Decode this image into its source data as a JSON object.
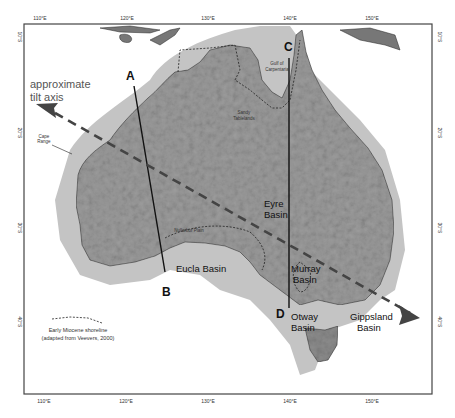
{
  "map": {
    "title": "Australia relief map with tilt axis and cross-sections",
    "frame": {
      "left": 24,
      "top": 24,
      "right": 432,
      "bottom": 394
    },
    "longitude_ticks": [
      {
        "label": "110°E",
        "x": 40
      },
      {
        "label": "120°E",
        "x": 127
      },
      {
        "label": "130°E",
        "x": 208
      },
      {
        "label": "140°E",
        "x": 290
      },
      {
        "label": "150°E",
        "x": 372
      }
    ],
    "latitude_ticks_left": [
      {
        "label": "10°S",
        "y": 37
      },
      {
        "label": "20°S",
        "y": 133
      },
      {
        "label": "30°S",
        "y": 228
      },
      {
        "label": "40°S",
        "y": 322
      }
    ],
    "latitude_ticks_right": [
      {
        "label": "10°S",
        "y": 37
      },
      {
        "label": "20°S",
        "y": 133
      },
      {
        "label": "30°S",
        "y": 228
      },
      {
        "label": "40°S",
        "y": 322
      }
    ],
    "tilt_axis": {
      "label_line1": "approximate",
      "label_line2": "tilt axis"
    },
    "section_letters": {
      "A": "A",
      "B": "B",
      "C": "C",
      "D": "D"
    },
    "places": {
      "cape_range_1": "Cape",
      "cape_range_2": "Range",
      "gulf_1": "Gulf of",
      "gulf_2": "Carpentaria",
      "sandy_1": "Sandy",
      "sandy_2": "Tablelands",
      "nullarbor": "Nullarbor Plain"
    },
    "basins": {
      "eyre_1": "Eyre",
      "eyre_2": "Basin",
      "eucla": "Eucla Basin",
      "murray_1": "Murray",
      "murray_2": "Basin",
      "otway_1": "Otway",
      "otway_2": "Basin",
      "gippsland_1": "Gippsland",
      "gippsland_2": "Basin"
    },
    "legend": {
      "line1": "Early Miocene shoreline",
      "line2": "(adapted from Veevers, 2000)"
    },
    "colors": {
      "land": "#9a9a9a",
      "shelf": "#bdbdbd",
      "relief_dark": "#555555",
      "sea": "#ffffff",
      "frame": "#444444",
      "axis_arrow": "#444444"
    }
  }
}
